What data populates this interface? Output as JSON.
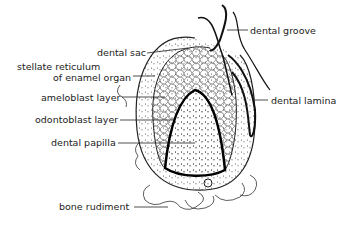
{
  "diagram": {
    "labels": {
      "dental_groove": "dental groove",
      "dental_sac": "dental sac",
      "stellate_line1": "stellate reticulum",
      "stellate_line2": "of enamel organ",
      "ameloblast": "ameloblast layer",
      "dental_lamina": "dental lamina",
      "odontoblast": "odontoblast layer",
      "dental_papilla": "dental papilla",
      "bone_rudiment": "bone rudiment"
    }
  }
}
